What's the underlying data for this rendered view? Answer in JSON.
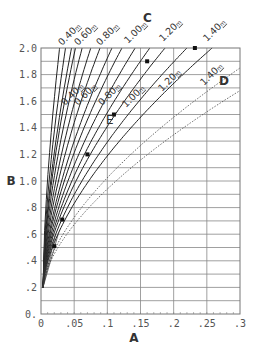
{
  "chart_data": {
    "type": "line",
    "title": "",
    "xlabel": "A",
    "ylabel": "B",
    "xlim": [
      0,
      0.3
    ],
    "ylim": [
      0,
      2.0
    ],
    "grid": true,
    "x_ticks": [
      "0",
      ".05",
      ".1",
      ".15",
      ".2",
      ".25",
      ".3"
    ],
    "y_ticks": [
      "0.",
      ".2",
      ".4",
      ".6",
      ".8",
      "1.0",
      "1.2",
      "1.4",
      "1.6",
      "1.8",
      "2.0"
    ],
    "origin": {
      "A": 0.003,
      "B": 0.2
    },
    "series_families": [
      {
        "name": "C",
        "style": "solid",
        "curve_labels": [
          "0.40",
          "0.60",
          "0.80",
          "1.00",
          "1.20",
          "1.40"
        ],
        "curves_end_A_at_B2": [
          0.028,
          0.037,
          0.046,
          0.052,
          0.062,
          0.075,
          0.089,
          0.107,
          0.122,
          0.142,
          0.164,
          0.187
        ]
      },
      {
        "name": "D",
        "style": "solid",
        "curve_labels": [
          "0.40",
          "0.60",
          "0.80",
          "1.00",
          "1.20",
          "1.40"
        ],
        "curves_end_A_at_B2": [
          0.22,
          0.258
        ]
      },
      {
        "name": "D-dotted",
        "style": "dotted",
        "curves_end_B_at_A03": [
          1.85,
          1.68
        ]
      }
    ],
    "points": [
      {
        "A": 0.02,
        "B": 0.51
      },
      {
        "A": 0.032,
        "B": 0.71
      },
      {
        "A": 0.07,
        "B": 1.2
      },
      {
        "A": 0.11,
        "B": 1.5,
        "label": "E"
      },
      {
        "A": 0.16,
        "B": 1.9
      },
      {
        "A": 0.232,
        "B": 2.0
      }
    ],
    "annotations": [
      "C",
      "D",
      "E"
    ]
  },
  "labels": {
    "x_axis": "A",
    "y_axis": "B",
    "family_c": "C",
    "family_d": "D",
    "point_e": "E",
    "upper": [
      "0.40",
      "0.60",
      "0.80",
      "1.00",
      "1.20",
      "1.40"
    ],
    "lower": [
      "0.40",
      "0.60",
      "0.80",
      "1.00",
      "1.20",
      "1.40"
    ],
    "unit": "m"
  }
}
